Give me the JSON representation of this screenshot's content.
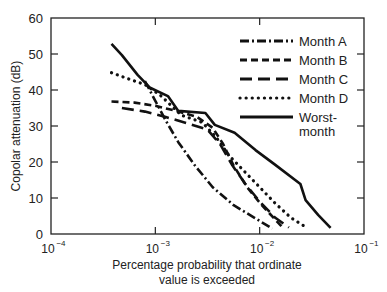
{
  "chart_data": {
    "type": "line",
    "title": "",
    "xlabel_line1": "Percentage probability that ordinate",
    "xlabel_line2": "value is exceeded",
    "ylabel": "Copolar attenuation (dB)",
    "xscale": "log",
    "xlim": [
      0.0001,
      0.1
    ],
    "ylim": [
      0,
      60
    ],
    "x_ticks": [
      {
        "exp": -4,
        "label": "10",
        "sup": "−4"
      },
      {
        "exp": -3,
        "label": "10",
        "sup": "−3"
      },
      {
        "exp": -2,
        "label": "10",
        "sup": "−2"
      },
      {
        "exp": -1,
        "label": "10",
        "sup": "−1"
      }
    ],
    "y_ticks": [
      0,
      10,
      20,
      30,
      40,
      50,
      60
    ],
    "grid": false,
    "legend_position": "upper right",
    "series": [
      {
        "name": "Month A",
        "style": "dashdot",
        "points": [
          [
            -3.1,
            42.5
          ],
          [
            -3.0,
            37.0
          ],
          [
            -2.9,
            31.5
          ],
          [
            -2.78,
            25.5
          ],
          [
            -2.62,
            19.0
          ],
          [
            -2.45,
            13.0
          ],
          [
            -2.25,
            8.0
          ],
          [
            -2.05,
            4.5
          ],
          [
            -1.88,
            1.5
          ]
        ]
      },
      {
        "name": "Month B",
        "style": "dashed-short",
        "points": [
          [
            -3.42,
            36.8
          ],
          [
            -3.2,
            36.5
          ],
          [
            -3.0,
            35.6
          ],
          [
            -2.8,
            34.2
          ],
          [
            -2.6,
            32.5
          ],
          [
            -2.45,
            29.5
          ],
          [
            -2.35,
            25.0
          ],
          [
            -2.25,
            19.0
          ],
          [
            -2.12,
            13.0
          ],
          [
            -1.98,
            8.0
          ],
          [
            -1.85,
            4.0
          ],
          [
            -1.78,
            1.8
          ]
        ]
      },
      {
        "name": "Month C",
        "style": "dashed-long",
        "points": [
          [
            -3.32,
            35.0
          ],
          [
            -3.1,
            34.0
          ],
          [
            -2.9,
            32.5
          ],
          [
            -2.7,
            30.8
          ],
          [
            -2.5,
            29.0
          ],
          [
            -2.38,
            25.0
          ],
          [
            -2.26,
            19.0
          ],
          [
            -2.14,
            14.0
          ],
          [
            -2.0,
            9.0
          ],
          [
            -1.85,
            4.5
          ],
          [
            -1.72,
            1.8
          ]
        ]
      },
      {
        "name": "Month D",
        "style": "dotted",
        "points": [
          [
            -3.42,
            44.8
          ],
          [
            -3.25,
            43.0
          ],
          [
            -3.1,
            41.5
          ],
          [
            -2.95,
            38.5
          ],
          [
            -2.75,
            33.0
          ],
          [
            -2.55,
            31.0
          ],
          [
            -2.42,
            27.0
          ],
          [
            -2.3,
            22.0
          ],
          [
            -2.15,
            17.5
          ],
          [
            -2.0,
            13.0
          ],
          [
            -1.85,
            8.5
          ],
          [
            -1.7,
            4.5
          ],
          [
            -1.55,
            1.8
          ]
        ]
      },
      {
        "name": "Worst-month",
        "style": "solid",
        "points": [
          [
            -3.42,
            52.8
          ],
          [
            -3.32,
            49.7
          ],
          [
            -3.17,
            44.2
          ],
          [
            -3.05,
            40.6
          ],
          [
            -2.88,
            38.3
          ],
          [
            -2.78,
            34.2
          ],
          [
            -2.52,
            33.6
          ],
          [
            -2.43,
            30.3
          ],
          [
            -2.24,
            28.1
          ],
          [
            -2.04,
            23.3
          ],
          [
            -1.85,
            19.2
          ],
          [
            -1.61,
            13.9
          ],
          [
            -1.56,
            9.4
          ],
          [
            -1.44,
            5.3
          ],
          [
            -1.32,
            1.7
          ]
        ]
      }
    ]
  },
  "legend": {
    "items": [
      {
        "label": "Month A"
      },
      {
        "label": "Month B"
      },
      {
        "label": "Month C"
      },
      {
        "label": "Month D"
      },
      {
        "label": "Worst-",
        "label2": "month"
      }
    ]
  }
}
